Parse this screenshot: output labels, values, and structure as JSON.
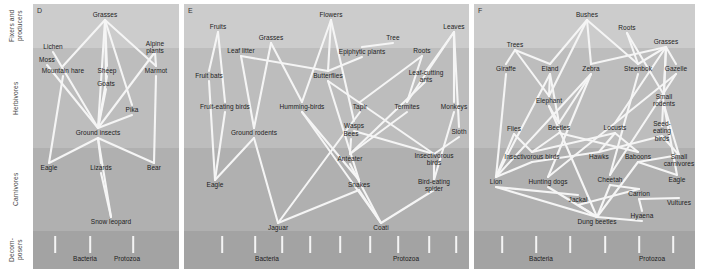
{
  "figure": {
    "width": 701,
    "height": 271,
    "background": "#ffffff",
    "link_color": "#f5f5f5",
    "text_color": "#1c1c1c"
  },
  "axis": {
    "labels": [
      {
        "name": "fixers-and-producers",
        "text": "Fixers and\nproducers",
        "top": 4,
        "height": 44
      },
      {
        "name": "herbivores",
        "text": "Herbivores",
        "top": 48,
        "height": 100
      },
      {
        "name": "carnivores",
        "text": "Carnivores",
        "top": 148,
        "height": 83
      },
      {
        "name": "decomposers",
        "text": "Decom-\nposers",
        "top": 231,
        "height": 38
      }
    ]
  },
  "bands": [
    {
      "name": "producers",
      "top": 4,
      "height": 44,
      "color": "#cccccc"
    },
    {
      "name": "herbivores",
      "top": 48,
      "height": 100,
      "color": "#bdbdbd"
    },
    {
      "name": "carnivores",
      "top": 148,
      "height": 83,
      "color": "#b0b0b0"
    },
    {
      "name": "decomposers",
      "top": 231,
      "height": 38,
      "color": "#a3a3a3"
    }
  ],
  "panels": [
    {
      "id": "D",
      "letter": "D",
      "left": 33,
      "width": 146,
      "decomposer_labels": [
        {
          "text": "Bacteria",
          "x": 52,
          "y": 258
        },
        {
          "text": "Protozoa",
          "x": 94,
          "y": 258
        }
      ],
      "ticks": [
        {
          "x": 22,
          "y": 236,
          "h": 17
        },
        {
          "x": 57,
          "y": 236,
          "h": 17
        },
        {
          "x": 100,
          "y": 236,
          "h": 17
        }
      ],
      "nodes": [
        {
          "name": "grasses",
          "text": "Grasses",
          "x": 72,
          "y": 15
        },
        {
          "name": "lichen",
          "text": "Lichen",
          "x": 20,
          "y": 47
        },
        {
          "name": "alpine-plants",
          "text": "Alpine plants",
          "x": 122,
          "y": 47
        },
        {
          "name": "moss",
          "text": "Moss",
          "x": 14,
          "y": 60
        },
        {
          "name": "mountain-hare",
          "text": "Mountain hare",
          "x": 30,
          "y": 71
        },
        {
          "name": "sheep",
          "text": "Sheep",
          "x": 74,
          "y": 71
        },
        {
          "name": "marmot",
          "text": "Marmot",
          "x": 123,
          "y": 71
        },
        {
          "name": "goats",
          "text": "Goats",
          "x": 73,
          "y": 84
        },
        {
          "name": "pika",
          "text": "Pika",
          "x": 99,
          "y": 110
        },
        {
          "name": "ground-insects",
          "text": "Ground insects",
          "x": 65,
          "y": 133
        },
        {
          "name": "eagle",
          "text": "Eagle",
          "x": 16,
          "y": 168
        },
        {
          "name": "lizards",
          "text": "Lizards",
          "x": 68,
          "y": 168
        },
        {
          "name": "bear",
          "text": "Bear",
          "x": 121,
          "y": 168
        },
        {
          "name": "snow-leopard",
          "text": "Snow leopard",
          "x": 78,
          "y": 222
        }
      ],
      "links": [
        [
          "grasses",
          "mountain-hare"
        ],
        [
          "grasses",
          "sheep"
        ],
        [
          "grasses",
          "goats"
        ],
        [
          "grasses",
          "pika"
        ],
        [
          "grasses",
          "ground-insects"
        ],
        [
          "grasses",
          "marmot"
        ],
        [
          "lichen",
          "ground-insects"
        ],
        [
          "moss",
          "ground-insects"
        ],
        [
          "alpine-plants",
          "marmot"
        ],
        [
          "alpine-plants",
          "ground-insects"
        ],
        [
          "mountain-hare",
          "eagle"
        ],
        [
          "sheep",
          "ground-insects"
        ],
        [
          "marmot",
          "bear"
        ],
        [
          "pika",
          "ground-insects"
        ],
        [
          "ground-insects",
          "eagle"
        ],
        [
          "ground-insects",
          "lizards"
        ],
        [
          "ground-insects",
          "bear"
        ],
        [
          "lizards",
          "snow-leopard"
        ],
        [
          "ground-insects",
          "snow-leopard"
        ],
        [
          "goats",
          "ground-insects"
        ]
      ]
    },
    {
      "id": "E",
      "letter": "E",
      "left": 184,
      "width": 285,
      "decomposer_labels": [
        {
          "text": "Bacteria",
          "x": 83,
          "y": 258
        },
        {
          "text": "Protozoa",
          "x": 222,
          "y": 258
        }
      ],
      "ticks": [
        {
          "x": 38,
          "y": 236,
          "h": 17
        },
        {
          "x": 71,
          "y": 236,
          "h": 17
        },
        {
          "x": 98,
          "y": 236,
          "h": 17
        },
        {
          "x": 126,
          "y": 236,
          "h": 17
        },
        {
          "x": 156,
          "y": 236,
          "h": 17
        },
        {
          "x": 186,
          "y": 236,
          "h": 17
        },
        {
          "x": 214,
          "y": 236,
          "h": 17
        },
        {
          "x": 245,
          "y": 236,
          "h": 17
        },
        {
          "x": 272,
          "y": 236,
          "h": 17
        }
      ],
      "nodes": [
        {
          "name": "flowers",
          "text": "Flowers",
          "x": 147,
          "y": 15
        },
        {
          "name": "leaves",
          "text": "Leaves",
          "x": 270,
          "y": 27
        },
        {
          "name": "fruits",
          "text": "Fruits",
          "x": 34,
          "y": 27
        },
        {
          "name": "grasses",
          "text": "Grasses",
          "x": 87,
          "y": 38
        },
        {
          "name": "tree",
          "text": "Tree",
          "x": 209,
          "y": 38
        },
        {
          "name": "leaf-litter",
          "text": "Leaf litter",
          "x": 57,
          "y": 51
        },
        {
          "name": "epiphytic-plants",
          "text": "Epiphytic plants",
          "x": 178,
          "y": 52
        },
        {
          "name": "roots",
          "text": "Roots",
          "x": 238,
          "y": 51
        },
        {
          "name": "fruit-bats",
          "text": "Fruit bats",
          "x": 25,
          "y": 76
        },
        {
          "name": "butterflies",
          "text": "Butterflies",
          "x": 144,
          "y": 76
        },
        {
          "name": "leaf-cutting-ants",
          "text": "Leaf-cutting ants",
          "x": 242,
          "y": 76
        },
        {
          "name": "fruit-eating-birds",
          "text": "Fruit-eating birds",
          "x": 41,
          "y": 107
        },
        {
          "name": "humming-birds",
          "text": "Humming-birds",
          "x": 118,
          "y": 107
        },
        {
          "name": "tapir",
          "text": "Tapir",
          "x": 176,
          "y": 107
        },
        {
          "name": "termites",
          "text": "Termites",
          "x": 223,
          "y": 107
        },
        {
          "name": "monkeys",
          "text": "Monkeys",
          "x": 270,
          "y": 107
        },
        {
          "name": "wasps",
          "text": "Wasps",
          "x": 170,
          "y": 126
        },
        {
          "name": "bees",
          "text": "Bees",
          "x": 167,
          "y": 134
        },
        {
          "name": "ground-rodents",
          "text": "Ground rodents",
          "x": 70,
          "y": 133
        },
        {
          "name": "sloth",
          "text": "Sloth",
          "x": 275,
          "y": 132
        },
        {
          "name": "anteater",
          "text": "Anteater",
          "x": 166,
          "y": 159
        },
        {
          "name": "insectivorous-birds",
          "text": "Insectivorous birds",
          "x": 250,
          "y": 159
        },
        {
          "name": "eagle",
          "text": "Eagle",
          "x": 31,
          "y": 185
        },
        {
          "name": "snakes",
          "text": "Snakes",
          "x": 175,
          "y": 185
        },
        {
          "name": "bird-eating-spider",
          "text": "Bird-eating spider",
          "x": 250,
          "y": 185
        },
        {
          "name": "jaguar",
          "text": "Jaguar",
          "x": 94,
          "y": 228
        },
        {
          "name": "coati",
          "text": "Coati",
          "x": 197,
          "y": 228
        }
      ],
      "links": [
        [
          "fruits",
          "fruit-bats"
        ],
        [
          "fruits",
          "fruit-eating-birds"
        ],
        [
          "leaf-litter",
          "ground-rodents"
        ],
        [
          "leaf-litter",
          "butterflies"
        ],
        [
          "grasses",
          "ground-rodents"
        ],
        [
          "grasses",
          "humming-birds"
        ],
        [
          "flowers",
          "butterflies"
        ],
        [
          "flowers",
          "humming-birds"
        ],
        [
          "flowers",
          "wasps"
        ],
        [
          "epiphytic-plants",
          "butterflies"
        ],
        [
          "tree",
          "epiphytic-plants"
        ],
        [
          "roots",
          "tapir"
        ],
        [
          "roots",
          "termites"
        ],
        [
          "leaves",
          "leaf-cutting-ants"
        ],
        [
          "leaves",
          "monkeys"
        ],
        [
          "leaves",
          "sloth"
        ],
        [
          "leaves",
          "termites"
        ],
        [
          "fruit-bats",
          "eagle"
        ],
        [
          "fruit-eating-birds",
          "eagle"
        ],
        [
          "ground-rodents",
          "eagle"
        ],
        [
          "ground-rodents",
          "jaguar"
        ],
        [
          "butterflies",
          "insectivorous-birds"
        ],
        [
          "humming-birds",
          "snakes"
        ],
        [
          "tapir",
          "jaguar"
        ],
        [
          "termites",
          "anteater"
        ],
        [
          "leaf-cutting-ants",
          "anteater"
        ],
        [
          "monkeys",
          "bird-eating-spider"
        ],
        [
          "sloth",
          "insectivorous-birds"
        ],
        [
          "wasps",
          "insectivorous-birds"
        ],
        [
          "bees",
          "anteater"
        ],
        [
          "anteater",
          "coati"
        ],
        [
          "snakes",
          "coati"
        ],
        [
          "insectivorous-birds",
          "bird-eating-spider"
        ],
        [
          "bird-eating-spider",
          "coati"
        ],
        [
          "snakes",
          "jaguar"
        ],
        [
          "humming-birds",
          "coati"
        ],
        [
          "butterflies",
          "snakes"
        ]
      ]
    },
    {
      "id": "F",
      "letter": "F",
      "left": 474,
      "width": 221,
      "decomposer_labels": [
        {
          "text": "Bacteria",
          "x": 67,
          "y": 258
        },
        {
          "text": "Protozoa",
          "x": 178,
          "y": 258
        }
      ],
      "ticks": [
        {
          "x": 28,
          "y": 236,
          "h": 17
        },
        {
          "x": 62,
          "y": 236,
          "h": 17
        },
        {
          "x": 96,
          "y": 236,
          "h": 17
        },
        {
          "x": 131,
          "y": 236,
          "h": 17
        },
        {
          "x": 165,
          "y": 236,
          "h": 17
        },
        {
          "x": 199,
          "y": 236,
          "h": 17
        }
      ],
      "nodes": [
        {
          "name": "bushes",
          "text": "Bushes",
          "x": 113,
          "y": 15
        },
        {
          "name": "roots",
          "text": "Roots",
          "x": 153,
          "y": 28
        },
        {
          "name": "grasses",
          "text": "Grasses",
          "x": 192,
          "y": 42
        },
        {
          "name": "trees",
          "text": "Trees",
          "x": 41,
          "y": 45
        },
        {
          "name": "giraffe",
          "text": "Giraffe",
          "x": 32,
          "y": 69
        },
        {
          "name": "eland",
          "text": "Eland",
          "x": 76,
          "y": 69
        },
        {
          "name": "zebra",
          "text": "Zebra",
          "x": 117,
          "y": 69
        },
        {
          "name": "steenbok",
          "text": "Steenbok",
          "x": 164,
          "y": 69
        },
        {
          "name": "gazelle",
          "text": "Gazelle",
          "x": 202,
          "y": 69
        },
        {
          "name": "elephant",
          "text": "Elephant",
          "x": 75,
          "y": 101
        },
        {
          "name": "small-rodents",
          "text": "Small rodents",
          "x": 190,
          "y": 100
        },
        {
          "name": "flies",
          "text": "Flies",
          "x": 40,
          "y": 129
        },
        {
          "name": "beetles",
          "text": "Beetles",
          "x": 85,
          "y": 128
        },
        {
          "name": "locusts",
          "text": "Locusts",
          "x": 141,
          "y": 128
        },
        {
          "name": "seed-eating-birds",
          "text": "Seed-eating\nbirds",
          "x": 188,
          "y": 131
        },
        {
          "name": "insectivorous-birds",
          "text": "Insectivorous birds",
          "x": 58,
          "y": 157
        },
        {
          "name": "hawks",
          "text": "Hawks",
          "x": 125,
          "y": 157
        },
        {
          "name": "baboons",
          "text": "Baboons",
          "x": 164,
          "y": 157
        },
        {
          "name": "small-carnivores",
          "text": "Small\ncarnivores",
          "x": 205,
          "y": 160
        },
        {
          "name": "lion",
          "text": "Lion",
          "x": 22,
          "y": 182
        },
        {
          "name": "hunting-dogs",
          "text": "Hunting dogs",
          "x": 74,
          "y": 182
        },
        {
          "name": "cheetah",
          "text": "Cheetah",
          "x": 136,
          "y": 180
        },
        {
          "name": "eagle",
          "text": "Eagle",
          "x": 203,
          "y": 180
        },
        {
          "name": "jackal",
          "text": "Jackal",
          "x": 104,
          "y": 200
        },
        {
          "name": "carrion",
          "text": "Carrion",
          "x": 165,
          "y": 194
        },
        {
          "name": "vultures",
          "text": "Vultures",
          "x": 205,
          "y": 203
        },
        {
          "name": "hyaena",
          "text": "Hyaena",
          "x": 168,
          "y": 216
        },
        {
          "name": "dung-beetles",
          "text": "Dung beetles",
          "x": 123,
          "y": 222
        }
      ],
      "links": [
        [
          "trees",
          "giraffe"
        ],
        [
          "trees",
          "eland"
        ],
        [
          "trees",
          "elephant"
        ],
        [
          "bushes",
          "eland"
        ],
        [
          "bushes",
          "zebra"
        ],
        [
          "bushes",
          "elephant"
        ],
        [
          "bushes",
          "steenbok"
        ],
        [
          "roots",
          "steenbok"
        ],
        [
          "roots",
          "small-rodents"
        ],
        [
          "grasses",
          "zebra"
        ],
        [
          "grasses",
          "gazelle"
        ],
        [
          "grasses",
          "steenbok"
        ],
        [
          "grasses",
          "small-rodents"
        ],
        [
          "grasses",
          "seed-eating-birds"
        ],
        [
          "grasses",
          "locusts"
        ],
        [
          "giraffe",
          "lion"
        ],
        [
          "eland",
          "elephant"
        ],
        [
          "eland",
          "beetles"
        ],
        [
          "eland",
          "lion"
        ],
        [
          "zebra",
          "lion"
        ],
        [
          "zebra",
          "beetles"
        ],
        [
          "zebra",
          "hunting-dogs"
        ],
        [
          "steenbok",
          "cheetah"
        ],
        [
          "gazelle",
          "cheetah"
        ],
        [
          "gazelle",
          "hunting-dogs"
        ],
        [
          "elephant",
          "beetles"
        ],
        [
          "elephant",
          "dung-beetles"
        ],
        [
          "small-rodents",
          "small-carnivores"
        ],
        [
          "small-rodents",
          "eagle"
        ],
        [
          "seed-eating-birds",
          "small-carnivores"
        ],
        [
          "seed-eating-birds",
          "hawks"
        ],
        [
          "flies",
          "lion"
        ],
        [
          "flies",
          "insectivorous-birds"
        ],
        [
          "beetles",
          "insectivorous-birds"
        ],
        [
          "beetles",
          "baboons"
        ],
        [
          "locusts",
          "baboons"
        ],
        [
          "locusts",
          "hawks"
        ],
        [
          "locusts",
          "insectivorous-birds"
        ],
        [
          "insectivorous-birds",
          "lion"
        ],
        [
          "insectivorous-birds",
          "hawks"
        ],
        [
          "baboons",
          "eagle"
        ],
        [
          "baboons",
          "small-carnivores"
        ],
        [
          "lion",
          "dung-beetles"
        ],
        [
          "lion",
          "jackal"
        ],
        [
          "hunting-dogs",
          "dung-beetles"
        ],
        [
          "cheetah",
          "dung-beetles"
        ],
        [
          "cheetah",
          "carrion"
        ],
        [
          "jackal",
          "dung-beetles"
        ],
        [
          "jackal",
          "carrion"
        ],
        [
          "carrion",
          "vultures"
        ],
        [
          "carrion",
          "hyaena"
        ],
        [
          "hyaena",
          "dung-beetles"
        ],
        [
          "baboons",
          "dung-beetles"
        ]
      ]
    }
  ]
}
